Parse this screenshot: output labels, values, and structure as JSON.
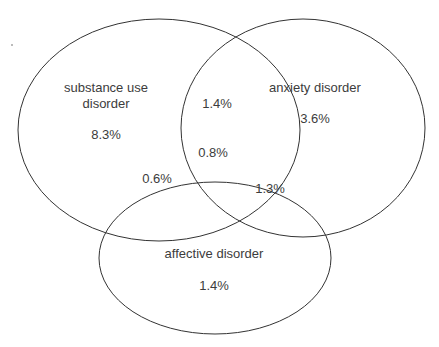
{
  "diagram": {
    "type": "venn",
    "sets": [
      {
        "id": "substance",
        "label": "substance use disorder",
        "label_lines": [
          "substance use",
          "disorder"
        ],
        "only_value": "8.3%"
      },
      {
        "id": "anxiety",
        "label": "anxiety disorder",
        "only_value": "3.6%"
      },
      {
        "id": "affective",
        "label": "affective disorder",
        "only_value": "1.4%"
      }
    ],
    "intersections": {
      "substance_anxiety": "1.4%",
      "substance_affective": "0.6%",
      "anxiety_affective": "1.3%",
      "all_three": "0.8%"
    },
    "outline_color": "#333333",
    "text_color": "#3c3c3c"
  }
}
